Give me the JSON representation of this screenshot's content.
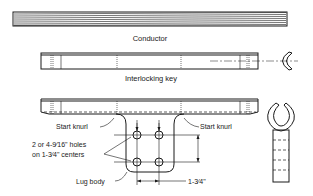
{
  "figure": {
    "colors": {
      "line": "#1a1a1a",
      "background": "#ffffff"
    },
    "components": {
      "conductor": {
        "label": "Conductor"
      },
      "interlocking_key": {
        "label": "Interlocking key"
      },
      "lug": {
        "label_body": "Lug body",
        "start_knurl_left": "Start knurl",
        "start_knurl_right": "Start knurl",
        "holes_line1": "2 or 4-9⁄16\" holes",
        "holes_line2": "on 1-3⁄4\" centers",
        "dimension": "1-3⁄4\""
      }
    }
  }
}
